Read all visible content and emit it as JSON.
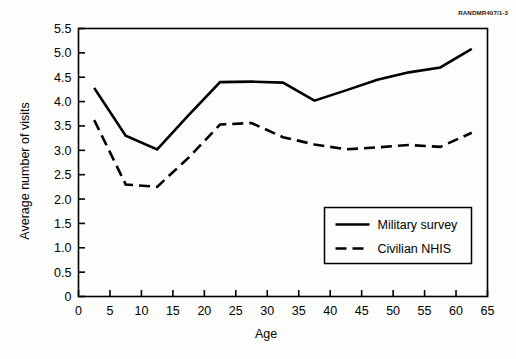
{
  "figure": {
    "rand_id": "RANDMR407/1-3"
  },
  "chart_data": {
    "type": "line",
    "title": "",
    "xlabel": "Age",
    "ylabel": "Average number of visits",
    "xlim": [
      0,
      65
    ],
    "ylim": [
      0,
      5.5
    ],
    "xticks": [
      0,
      5,
      10,
      15,
      20,
      25,
      30,
      35,
      40,
      45,
      50,
      55,
      60,
      65
    ],
    "xtick_labels": [
      "0",
      "5",
      "10",
      "15",
      "20",
      "25",
      "30",
      "35",
      "40",
      "45",
      "50",
      "55",
      "60",
      "65"
    ],
    "yticks": [
      0,
      0.5,
      1.0,
      1.5,
      2.0,
      2.5,
      3.0,
      3.5,
      4.0,
      4.5,
      5.0,
      5.5
    ],
    "ytick_labels": [
      "0",
      "0.5",
      "1.0",
      "1.5",
      "2.0",
      "2.5",
      "3.0",
      "3.5",
      "4.0",
      "4.5",
      "5.0",
      "5.5"
    ],
    "grid": false,
    "legend_position": "lower right",
    "x": [
      2.5,
      7.5,
      12.5,
      17.5,
      22.5,
      27.5,
      32.5,
      37.5,
      42.5,
      47.5,
      52.5,
      57.5,
      62.5
    ],
    "series": [
      {
        "name": "Military survey",
        "style": "solid",
        "color": "#000000",
        "values": [
          4.28,
          3.3,
          3.02,
          3.72,
          4.4,
          4.41,
          4.39,
          4.02,
          4.23,
          4.45,
          4.6,
          4.7,
          5.08
        ]
      },
      {
        "name": "Civilian NHIS",
        "style": "dashed",
        "color": "#000000",
        "values": [
          3.62,
          2.3,
          2.25,
          2.85,
          3.53,
          3.56,
          3.27,
          3.12,
          3.02,
          3.06,
          3.11,
          3.07,
          3.36
        ]
      }
    ]
  },
  "legend": {
    "items": [
      {
        "label": "Military survey",
        "style": "solid"
      },
      {
        "label": "Civilian NHIS",
        "style": "dashed"
      }
    ]
  }
}
